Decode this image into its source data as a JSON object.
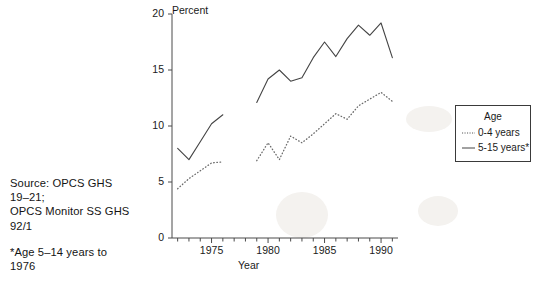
{
  "figure": {
    "clipped_title": "",
    "source_note_line1": "Source: OPCS GHS",
    "source_note_line2": "19–21;",
    "source_note_line3": "OPCS Monitor SS GHS",
    "source_note_line4": "92/1",
    "footnote_line1": "*Age 5–14 years to",
    "footnote_line2": "1976"
  },
  "legend": {
    "title": "Age",
    "items": [
      {
        "label": "0-4 years",
        "style": "dotted",
        "color": "#555555"
      },
      {
        "label": "5-15 years*",
        "style": "solid",
        "color": "#444444"
      }
    ]
  },
  "chart_data": {
    "type": "line",
    "title": "",
    "xlabel": "Year",
    "ylabel": "Percent",
    "xlim": [
      1971.5,
      1991.5
    ],
    "ylim": [
      0,
      20
    ],
    "yticks": [
      0,
      5,
      10,
      15,
      20
    ],
    "ytick_labels": [
      "0",
      "5",
      "10",
      "15",
      "20"
    ],
    "xticks": [
      1975,
      1980,
      1985,
      1990
    ],
    "xtick_labels": [
      "1975",
      "1980",
      "1985",
      "1990"
    ],
    "xtick_minor_step": 1,
    "grid": false,
    "legend_position": "right-outside",
    "series": [
      {
        "name": "5-15 years*",
        "style": "solid",
        "color": "#444444",
        "segments": [
          {
            "x": [
              1972,
              1973,
              1974,
              1975,
              1976
            ],
            "y": [
              8.0,
              7.0,
              8.6,
              10.2,
              11.0
            ]
          },
          {
            "x": [
              1979,
              1980,
              1981,
              1982,
              1983,
              1984,
              1985,
              1986,
              1987,
              1988,
              1989,
              1990,
              1991
            ],
            "y": [
              12.1,
              14.2,
              15.0,
              14.0,
              14.3,
              16.1,
              17.5,
              16.2,
              17.8,
              19.0,
              18.1,
              19.2,
              16.1
            ]
          }
        ]
      },
      {
        "name": "0-4 years",
        "style": "dotted",
        "color": "#6b6b6b",
        "segments": [
          {
            "x": [
              1972,
              1973,
              1974,
              1975,
              1976
            ],
            "y": [
              4.4,
              5.3,
              6.0,
              6.7,
              6.8
            ]
          },
          {
            "x": [
              1979,
              1980,
              1981,
              1982,
              1983,
              1984,
              1985,
              1986,
              1987,
              1988,
              1989,
              1990,
              1991
            ],
            "y": [
              6.9,
              8.5,
              7.0,
              9.1,
              8.5,
              9.3,
              10.2,
              11.1,
              10.6,
              11.8,
              12.4,
              13.0,
              12.2
            ]
          }
        ]
      }
    ]
  }
}
